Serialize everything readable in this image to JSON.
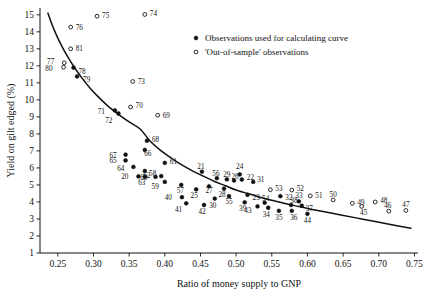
{
  "chart_data": {
    "type": "scatter",
    "title": "",
    "xlabel": "Ratio of money supply to GNP",
    "ylabel": "Yield on gilt edged (%)",
    "xlim": [
      0.225,
      0.755
    ],
    "ylim": [
      1,
      15.4
    ],
    "xticks": [
      "0.25",
      "0.30",
      "0.35",
      "0.40",
      "0.45",
      "0.50",
      "0.55",
      "0.60",
      "0.65",
      "0.70",
      "0.75"
    ],
    "xtick_values": [
      0.25,
      0.3,
      0.35,
      0.4,
      0.45,
      0.5,
      0.55,
      0.6,
      0.65,
      0.7,
      0.75
    ],
    "yticks": [
      "1",
      "2",
      "3",
      "4",
      "5",
      "6",
      "7",
      "8",
      "9",
      "10",
      "11",
      "12",
      "13",
      "14",
      "15"
    ],
    "ytick_values": [
      1,
      2,
      3,
      4,
      5,
      6,
      7,
      8,
      9,
      10,
      11,
      12,
      13,
      14,
      15
    ],
    "grid": false,
    "legend_position": "top-right",
    "legend": [
      {
        "marker": "filled-circle",
        "label": "Observations used for calculating curve"
      },
      {
        "marker": "open-circle",
        "label": "'Out-of-sample' observations"
      }
    ],
    "curve": {
      "name": "fitted curve",
      "points": [
        [
          0.236,
          15.1
        ],
        [
          0.245,
          14.1
        ],
        [
          0.255,
          13.2
        ],
        [
          0.265,
          12.45
        ],
        [
          0.275,
          11.8
        ],
        [
          0.285,
          11.22
        ],
        [
          0.295,
          10.7
        ],
        [
          0.305,
          10.25
        ],
        [
          0.32,
          9.65
        ],
        [
          0.335,
          9.15
        ],
        [
          0.35,
          8.7
        ],
        [
          0.365,
          8.3
        ],
        [
          0.38,
          7.55
        ],
        [
          0.395,
          7.0
        ],
        [
          0.41,
          6.55
        ],
        [
          0.425,
          6.15
        ],
        [
          0.44,
          5.8
        ],
        [
          0.455,
          5.5
        ],
        [
          0.47,
          5.2
        ],
        [
          0.485,
          4.95
        ],
        [
          0.5,
          4.7
        ],
        [
          0.52,
          4.45
        ],
        [
          0.54,
          4.2
        ],
        [
          0.56,
          4.0
        ],
        [
          0.58,
          3.8
        ],
        [
          0.6,
          3.62
        ],
        [
          0.62,
          3.45
        ],
        [
          0.645,
          3.25
        ],
        [
          0.67,
          3.05
        ],
        [
          0.695,
          2.85
        ],
        [
          0.72,
          2.65
        ],
        [
          0.745,
          2.45
        ]
      ]
    },
    "series": [
      {
        "name": "Observations used for calculating curve",
        "marker": "filled-circle",
        "points": [
          {
            "label": "20",
            "x": 0.363,
            "y": 5.5,
            "lx": -10,
            "ly": 1
          },
          {
            "label": "21",
            "x": 0.452,
            "y": 5.78,
            "lx": -1,
            "ly": -5
          },
          {
            "label": "22",
            "x": 0.508,
            "y": 5.32,
            "lx": 5,
            "ly": -2
          },
          {
            "label": "23",
            "x": 0.516,
            "y": 4.42,
            "lx": 5,
            "ly": 3
          },
          {
            "label": "24",
            "x": 0.505,
            "y": 5.62,
            "lx": 0,
            "ly": -7
          },
          {
            "label": "25",
            "x": 0.444,
            "y": 4.74,
            "lx": -2,
            "ly": 7
          },
          {
            "label": "26",
            "x": 0.497,
            "y": 5.26,
            "lx": 1,
            "ly": -4
          },
          {
            "label": "27",
            "x": 0.462,
            "y": 4.92,
            "lx": 0,
            "ly": 5
          },
          {
            "label": "28",
            "x": 0.483,
            "y": 4.78,
            "lx": -2,
            "ly": 6
          },
          {
            "label": "29",
            "x": 0.487,
            "y": 5.33,
            "lx": 0,
            "ly": -4
          },
          {
            "label": "30",
            "x": 0.47,
            "y": 4.2,
            "lx": -2,
            "ly": 7
          },
          {
            "label": "31",
            "x": 0.524,
            "y": 5.18,
            "lx": 4,
            "ly": -2
          },
          {
            "label": "32",
            "x": 0.562,
            "y": 4.34,
            "lx": 5,
            "ly": 2
          },
          {
            "label": "33",
            "x": 0.588,
            "y": 4.04,
            "lx": 0,
            "ly": -5
          },
          {
            "label": "34",
            "x": 0.545,
            "y": 3.66,
            "lx": -2,
            "ly": 7
          },
          {
            "label": "35",
            "x": 0.56,
            "y": 3.48,
            "lx": 0,
            "ly": 7
          },
          {
            "label": "36",
            "x": 0.578,
            "y": 3.48,
            "lx": 2,
            "ly": 7
          },
          {
            "label": "37",
            "x": 0.592,
            "y": 3.78,
            "lx": 4,
            "ly": 3
          },
          {
            "label": "38",
            "x": 0.577,
            "y": 3.82,
            "lx": 3,
            "ly": -4
          },
          {
            "label": "39",
            "x": 0.512,
            "y": 3.98,
            "lx": -2,
            "ly": 7
          },
          {
            "label": "40",
            "x": 0.424,
            "y": 4.28,
            "lx": -10,
            "ly": 1
          },
          {
            "label": "41",
            "x": 0.43,
            "y": 3.92,
            "lx": -4,
            "ly": 7
          },
          {
            "label": "42",
            "x": 0.455,
            "y": 3.82,
            "lx": -2,
            "ly": 7
          },
          {
            "label": "43",
            "x": 0.53,
            "y": 3.74,
            "lx": -6,
            "ly": 5
          },
          {
            "label": "44",
            "x": 0.6,
            "y": 3.3,
            "lx": 0,
            "ly": 7
          },
          {
            "label": "54",
            "x": 0.54,
            "y": 3.96,
            "lx": 1,
            "ly": -4
          },
          {
            "label": "55",
            "x": 0.49,
            "y": 4.34,
            "lx": 0,
            "ly": 6
          },
          {
            "label": "56",
            "x": 0.473,
            "y": 5.4,
            "lx": -1,
            "ly": -4
          },
          {
            "label": "57",
            "x": 0.423,
            "y": 5.0,
            "lx": -1,
            "ly": 6
          },
          {
            "label": "58",
            "x": 0.395,
            "y": 5.52,
            "lx": -5,
            "ly": -2
          },
          {
            "label": "59",
            "x": 0.4,
            "y": 5.18,
            "lx": -6,
            "ly": 5
          },
          {
            "label": "60",
            "x": 0.387,
            "y": 5.48,
            "lx": -8,
            "ly": 1
          },
          {
            "label": "61",
            "x": 0.4,
            "y": 6.3,
            "lx": 5,
            "ly": -1
          },
          {
            "label": "62",
            "x": 0.372,
            "y": 5.82,
            "lx": 2,
            "ly": 5
          },
          {
            "label": "63",
            "x": 0.372,
            "y": 5.48,
            "lx": -3,
            "ly": 6
          },
          {
            "label": "64",
            "x": 0.356,
            "y": 6.06,
            "lx": -9,
            "ly": 2
          },
          {
            "label": "65",
            "x": 0.345,
            "y": 6.44,
            "lx": -9,
            "ly": 1
          },
          {
            "label": "66",
            "x": 0.372,
            "y": 7.06,
            "lx": 3,
            "ly": 4
          },
          {
            "label": "67",
            "x": 0.345,
            "y": 6.78,
            "lx": -9,
            "ly": 1
          },
          {
            "label": "68",
            "x": 0.375,
            "y": 7.6,
            "lx": 5,
            "ly": -1
          },
          {
            "label": "71",
            "x": 0.33,
            "y": 9.38,
            "lx": -10,
            "ly": 2
          },
          {
            "label": "72",
            "x": 0.335,
            "y": 9.2,
            "lx": -6,
            "ly": 8
          },
          {
            "label": "78",
            "x": 0.272,
            "y": 11.9,
            "lx": 5,
            "ly": 4
          },
          {
            "label": "79",
            "x": 0.277,
            "y": 11.38,
            "lx": 6,
            "ly": 4
          }
        ]
      },
      {
        "name": "'Out-of-sample' observations",
        "marker": "open-circle",
        "points": [
          {
            "label": "45",
            "x": 0.676,
            "y": 3.74,
            "lx": 2,
            "ly": 7
          },
          {
            "label": "46",
            "x": 0.714,
            "y": 3.46,
            "lx": -1,
            "ly": -5
          },
          {
            "label": "47",
            "x": 0.738,
            "y": 3.5,
            "lx": 0,
            "ly": -5
          },
          {
            "label": "48",
            "x": 0.695,
            "y": 4.0,
            "lx": 5,
            "ly": -1
          },
          {
            "label": "49",
            "x": 0.663,
            "y": 3.92,
            "lx": 5,
            "ly": 0
          },
          {
            "label": "50",
            "x": 0.636,
            "y": 4.12,
            "lx": 0,
            "ly": -5
          },
          {
            "label": "51",
            "x": 0.604,
            "y": 4.36,
            "lx": 5,
            "ly": 0
          },
          {
            "label": "52",
            "x": 0.578,
            "y": 4.7,
            "lx": 5,
            "ly": -1
          },
          {
            "label": "53",
            "x": 0.548,
            "y": 4.72,
            "lx": 5,
            "ly": -1
          },
          {
            "label": "69",
            "x": 0.39,
            "y": 9.1,
            "lx": 5,
            "ly": 1
          },
          {
            "label": "70",
            "x": 0.352,
            "y": 9.58,
            "lx": 5,
            "ly": -1
          },
          {
            "label": "73",
            "x": 0.355,
            "y": 11.08,
            "lx": 5,
            "ly": 0
          },
          {
            "label": "74",
            "x": 0.372,
            "y": 15.02,
            "lx": 5,
            "ly": 0
          },
          {
            "label": "75",
            "x": 0.305,
            "y": 14.92,
            "lx": 5,
            "ly": 0
          },
          {
            "label": "76",
            "x": 0.268,
            "y": 14.28,
            "lx": 5,
            "ly": 1
          },
          {
            "label": "77",
            "x": 0.259,
            "y": 12.18,
            "lx": -10,
            "ly": -1
          },
          {
            "label": "80",
            "x": 0.258,
            "y": 11.92,
            "lx": -11,
            "ly": 2
          },
          {
            "label": "81",
            "x": 0.268,
            "y": 13.0,
            "lx": 5,
            "ly": 0
          }
        ]
      }
    ]
  }
}
